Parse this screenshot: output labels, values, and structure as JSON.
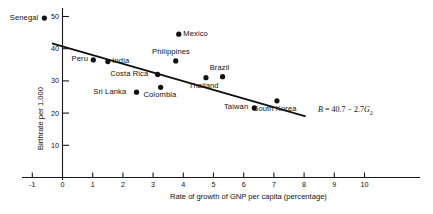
{
  "chart_data": {
    "type": "scatter",
    "title": "",
    "xlabel": "Rate of growth of GNP per capita (percentage)",
    "ylabel": "Birthrate per 1,000",
    "xlim": [
      -1.6,
      11.2
    ],
    "ylim": [
      0,
      55
    ],
    "xticks": [
      -1,
      0,
      1,
      2,
      3,
      4,
      5,
      6,
      7,
      8,
      9,
      10
    ],
    "xtick_labels": [
      "-1",
      "0",
      "1",
      "2",
      "3",
      "4",
      "5",
      "6",
      "7",
      "8",
      "9",
      "10"
    ],
    "yticks": [
      10,
      20,
      30,
      40,
      50
    ],
    "ytick_labels": [
      "10",
      "20",
      "30",
      "40",
      "50"
    ],
    "grid": false,
    "legend": "none",
    "points": [
      {
        "label": "Senegal",
        "x": -0.6,
        "y": 49.5,
        "label_pos": "left"
      },
      {
        "label": "Peru",
        "x": 1.02,
        "y": 36.5,
        "label_pos": "left"
      },
      {
        "label": "India",
        "x": 1.5,
        "y": 36.0,
        "label_pos": "right"
      },
      {
        "label": "Philippines",
        "x": 3.75,
        "y": 36.2,
        "label_pos": "above"
      },
      {
        "label": "Mexico",
        "x": 3.85,
        "y": 44.5,
        "label_pos": "right"
      },
      {
        "label": "Costa Rica",
        "x": 3.15,
        "y": 32.0,
        "label_pos": "left"
      },
      {
        "label": "Sri Lanka",
        "x": 2.45,
        "y": 26.5,
        "label_pos": "left"
      },
      {
        "label": "Colombia",
        "x": 3.25,
        "y": 28.0,
        "label_pos": "below"
      },
      {
        "label": "Thailand",
        "x": 4.75,
        "y": 31.0,
        "label_pos": "below"
      },
      {
        "label": "Brazil",
        "x": 5.3,
        "y": 31.3,
        "label_pos": "above"
      },
      {
        "label": "Taiwan",
        "x": 6.35,
        "y": 21.6,
        "label_pos": "left"
      },
      {
        "label": "South Korea",
        "x": 7.1,
        "y": 23.8,
        "label_pos": "below"
      }
    ],
    "fit_line": {
      "equation_text": "B = 40.7 − 2.7G",
      "equation_subscript": "2",
      "intercept": 40.7,
      "slope": -2.7,
      "x_start": -0.35,
      "x_end": 8.05
    },
    "annotations": [
      {
        "text": "B = 40.7 − 2.7G₂"
      }
    ]
  },
  "axes": {
    "x_title": "Rate of growth of GNP per capita (percentage)",
    "y_title": "Birthrate per 1,000"
  }
}
